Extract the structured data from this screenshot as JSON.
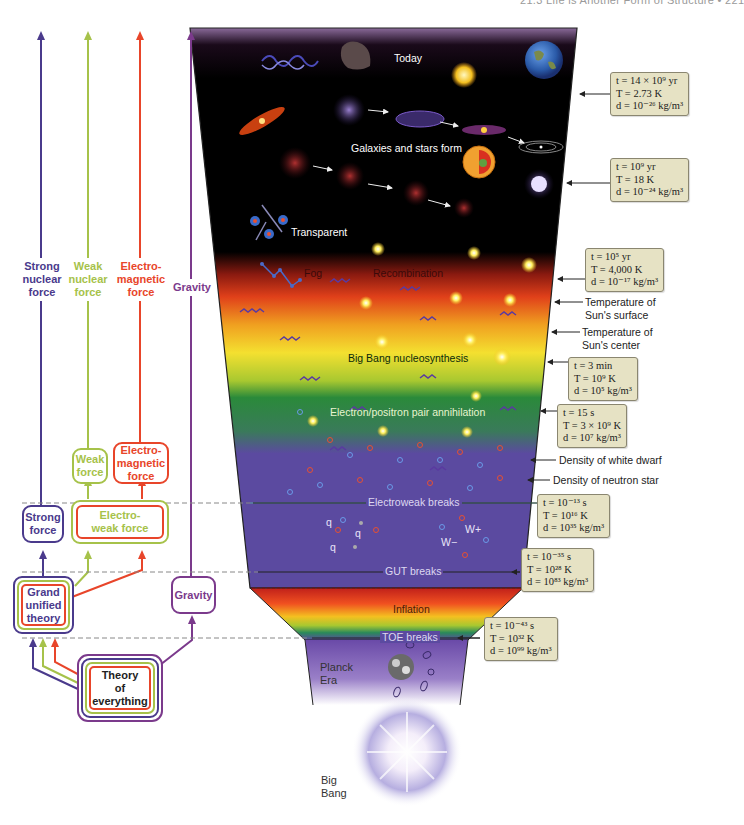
{
  "header": {
    "running_head": "21.3 Life is Another Form of Structure  •  221"
  },
  "forces": {
    "strong": {
      "label": "Strong nuclear force",
      "lines": [
        "Strong",
        "nuclear",
        "force"
      ],
      "color": "#4a3a8c"
    },
    "weak": {
      "label": "Weak nuclear force",
      "lines": [
        "Weak",
        "nuclear",
        "force"
      ],
      "color": "#a6c24a"
    },
    "electromagnetic": {
      "label": "Electro-magnetic force",
      "lines": [
        "Electro-",
        "magnetic",
        "force"
      ],
      "color": "#e8452a"
    },
    "gravity": {
      "label": "Gravity",
      "lines": [
        "Gravity"
      ],
      "color": "#7b3a8c"
    }
  },
  "boxes": {
    "weak_force": {
      "lines": [
        "Weak",
        "force"
      ]
    },
    "electromagnetic_force": {
      "lines": [
        "Electro-",
        "magnetic",
        "force"
      ]
    },
    "strong_force": {
      "lines": [
        "Strong",
        "force"
      ]
    },
    "electroweak_force": {
      "lines": [
        "Electro-",
        "weak force"
      ]
    },
    "grand_unified_theory": {
      "lines": [
        "Grand",
        "unified",
        "theory"
      ]
    },
    "gravity": {
      "lines": [
        "Gravity"
      ]
    },
    "theory_of_everything": {
      "lines": [
        "Theory",
        "of",
        "everything"
      ]
    }
  },
  "cone_labels": {
    "today": "Today",
    "galaxies": "Galaxies and stars form",
    "transparent": "Transparent",
    "fog": "Fog",
    "recombination": "Recombination",
    "nucleosynthesis": "Big Bang nucleosynthesis",
    "annihilation": "Electron/positron pair annihilation",
    "electroweak_breaks": "Electroweak breaks",
    "q1": "q",
    "q2": "q",
    "q3": "q",
    "w_minus": "W−",
    "w_plus": "W+",
    "gut_breaks": "GUT breaks",
    "inflation": "Inflation",
    "toe_breaks": "TOE breaks"
  },
  "eras": {
    "planck": [
      "Planck",
      "Era"
    ],
    "big_bang": [
      "Big",
      "Bang"
    ]
  },
  "info_boxes": [
    {
      "t": "t = 14 × 10⁹ yr",
      "T": "T = 2.73 K",
      "d": "d = 10⁻²⁶ kg/m³"
    },
    {
      "t": "t = 10⁹ yr",
      "T": "T = 18 K",
      "d": "d = 10⁻²⁴ kg/m³"
    },
    {
      "t": "t = 10⁵ yr",
      "T": "T = 4,000 K",
      "d": "d = 10⁻¹⁷ kg/m³"
    },
    {
      "t": "t = 3 min",
      "T": "T = 10⁹ K",
      "d": "d = 10⁵ kg/m³"
    },
    {
      "t": "t = 15 s",
      "T": "T = 3 × 10⁹ K",
      "d": "d = 10⁷ kg/m³"
    },
    {
      "t": "t = 10⁻¹³ s",
      "T": "T = 10¹⁶ K",
      "d": "d = 10³⁵ kg/m³"
    },
    {
      "t": "t = 10⁻³⁵ s",
      "T": "T = 10²⁸ K",
      "d": "d = 10⁸³ kg/m³"
    },
    {
      "t": "t = 10⁻⁴³ s",
      "T": "T = 10³² K",
      "d": "d = 10⁹⁹ kg/m³"
    }
  ],
  "side_notes": {
    "sun_surface": [
      "Temperature of",
      "Sun's surface"
    ],
    "sun_center": [
      "Temperature of",
      "Sun's center"
    ],
    "white_dwarf": "Density of white dwarf",
    "neutron_star": "Density of neutron star"
  },
  "colors": {
    "strong": "#4a3a8c",
    "weak": "#a6c24a",
    "electromagnetic": "#e8452a",
    "gravity": "#7b3a8c",
    "info_box_bg": "#e6e2c4",
    "cone_purple": "#5b4aa0"
  }
}
